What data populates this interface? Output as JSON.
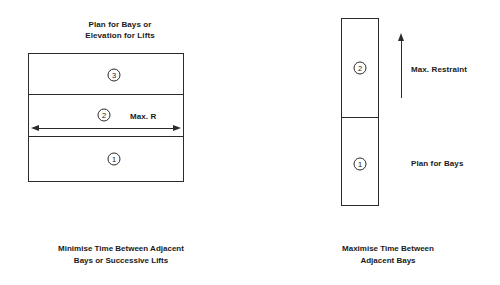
{
  "diagram": {
    "left": {
      "heading": "Plan for Bays or\nElevation for Lifts",
      "caption": "Minimise Time Between Adjacent\nBays or Successive Lifts",
      "bands": [
        {
          "marker": "3"
        },
        {
          "marker": "2"
        },
        {
          "marker": "1"
        }
      ],
      "arrow_label": "Max. R",
      "arrow_name": "horizontal-double-arrow"
    },
    "right": {
      "caption": "Maximise Time Between\nAdjacent Bays",
      "bands": [
        {
          "marker": "2"
        },
        {
          "marker": "1"
        }
      ],
      "arrow_label": "Max. Restraint",
      "lower_label": "Plan for Bays",
      "arrow_name": "vertical-up-arrow"
    }
  },
  "colors": {
    "stroke": "#2b2b2b",
    "text": "#1a1a1a",
    "background": "#ffffff"
  }
}
